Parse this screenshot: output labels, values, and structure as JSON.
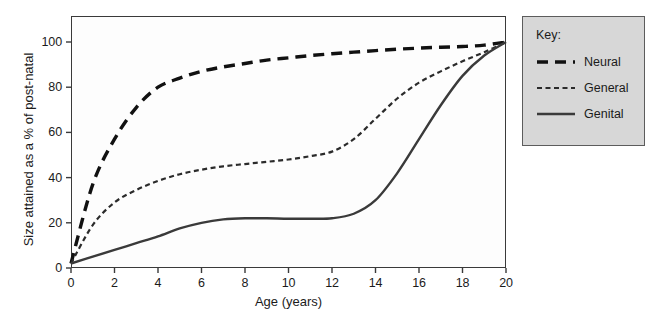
{
  "chart_data": {
    "type": "line",
    "title": "",
    "xlabel": "Age (years)",
    "ylabel": "Size attained as a % of post-natal",
    "xlim": [
      0,
      20
    ],
    "ylim": [
      0,
      105
    ],
    "grid": false,
    "legend_position": "right-outside",
    "legend_title": "Key:",
    "xticks": [
      0,
      2,
      4,
      6,
      8,
      10,
      12,
      14,
      16,
      18,
      20
    ],
    "xtick_labels": [
      "0",
      "2",
      "4",
      "6",
      "8",
      "10",
      "12",
      "14",
      "16",
      "18",
      "20"
    ],
    "yticks": [
      0,
      20,
      40,
      60,
      80,
      100
    ],
    "ytick_labels": [
      "0",
      "20",
      "40",
      "60",
      "80",
      "100"
    ],
    "x": [
      0,
      1,
      2,
      3,
      4,
      5,
      6,
      7,
      8,
      9,
      10,
      11,
      12,
      13,
      14,
      15,
      16,
      17,
      18,
      19,
      20
    ],
    "series": [
      {
        "name": "Neural",
        "style": "long-dash",
        "color": "#111111",
        "width": 3.4,
        "values": [
          2,
          37,
          57,
          71,
          80,
          84,
          87,
          89,
          90.5,
          92,
          93,
          94,
          94.8,
          95.5,
          96.2,
          96.8,
          97.3,
          97.7,
          98,
          98.6,
          100
        ]
      },
      {
        "name": "General",
        "style": "short-dash",
        "color": "#2b2b2b",
        "width": 2.2,
        "values": [
          2,
          19,
          29,
          34.5,
          38.5,
          41.5,
          43.5,
          45,
          46,
          47,
          48,
          49.5,
          51.5,
          57,
          66,
          75,
          82,
          87,
          91.5,
          95.5,
          100
        ]
      },
      {
        "name": "Genital",
        "style": "solid",
        "color": "#3a3a3a",
        "width": 2.4,
        "values": [
          2,
          5,
          8,
          11,
          14,
          17.5,
          20,
          21.5,
          22,
          22,
          21.8,
          21.8,
          22,
          24,
          30,
          42,
          57,
          72,
          85,
          94,
          100
        ]
      }
    ]
  },
  "legend": {
    "title": "Key:",
    "items": [
      {
        "label": "Neural",
        "style": "long-dash"
      },
      {
        "label": "General",
        "style": "short-dash"
      },
      {
        "label": "Genital",
        "style": "solid"
      }
    ]
  },
  "colors": {
    "frame": "#3a3a3a",
    "text": "#1b1b1b",
    "legend_bg": "#d7d7d7",
    "legend_border": "#5c5c5c",
    "plot_bg": "#fdfdfd"
  }
}
